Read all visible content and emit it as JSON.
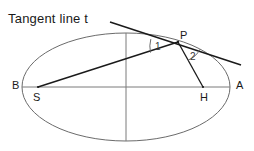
{
  "figure": {
    "title": "Tangent line  t",
    "background_color": "#ffffff",
    "stroke_color": "#1a1a1a",
    "curve_color": "#6b6b6b",
    "axis_color": "#7a7a7a"
  },
  "labels": {
    "tangent_title": "Tangent line  t",
    "point_B": "B",
    "point_A": "A",
    "point_S": "S",
    "point_H": "H",
    "point_P": "P",
    "angle_1": "1",
    "angle_2": "2"
  },
  "geometry": {
    "ellipse": {
      "center_x": 126,
      "center_y": 87,
      "radius_x": 104,
      "radius_y": 54
    },
    "major_axis": {
      "x1": 22,
      "y1": 87,
      "x2": 230,
      "y2": 87
    },
    "minor_axis": {
      "x1": 126,
      "y1": 33,
      "x2": 126,
      "y2": 141
    },
    "points": {
      "B": {
        "x": 22,
        "y": 87
      },
      "A": {
        "x": 230,
        "y": 87
      },
      "S": {
        "x": 38,
        "y": 87
      },
      "H": {
        "x": 203,
        "y": 87
      },
      "P": {
        "x": 178,
        "y": 42
      }
    },
    "tangent_segment": {
      "x1": 110,
      "y1": 22,
      "x2": 241,
      "y2": 65
    },
    "focal_chord_SP": {
      "x1": 38,
      "y1": 87,
      "x2": 178,
      "y2": 42
    },
    "normal_PH": {
      "x1": 178,
      "y1": 42,
      "x2": 203,
      "y2": 87
    }
  }
}
